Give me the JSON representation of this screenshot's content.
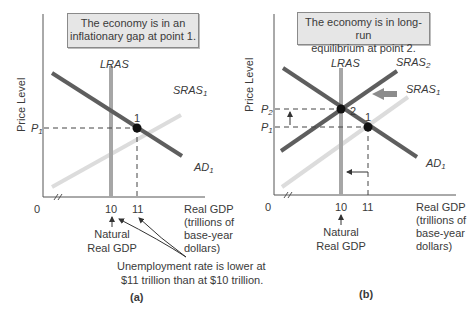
{
  "panels": [
    {
      "id": "a",
      "caption": "(a)",
      "callout": [
        "The economy is in an",
        "inflationary gap at point 1."
      ],
      "y_axis_label": "Price Level",
      "x_axis_label": [
        "Real GDP",
        "(trillions of",
        "base-year",
        "dollars)"
      ],
      "origin": "0",
      "x_ticks": [
        "10",
        "11"
      ],
      "y_ticks": [
        {
          "base": "P",
          "sub": "1"
        }
      ],
      "curves": {
        "lras": "LRAS",
        "sras1": {
          "base": "SRAS",
          "sub": "1"
        },
        "ad1": {
          "base": "AD",
          "sub": "1"
        }
      },
      "points": [
        "1"
      ],
      "annotations": {
        "natural_gdp": [
          "Natural",
          "Real GDP"
        ],
        "unemployment_note": [
          "Unemployment rate is lower at",
          "$11 trillion than at $10 trillion."
        ]
      }
    },
    {
      "id": "b",
      "caption": "(b)",
      "callout": [
        "The economy is in long-run",
        "equilibrium at point 2."
      ],
      "y_axis_label": "Price Level",
      "x_axis_label": [
        "Real GDP",
        "(trillions of",
        "base-year",
        "dollars)"
      ],
      "origin": "0",
      "x_ticks": [
        "10",
        "11"
      ],
      "y_ticks": [
        {
          "base": "P",
          "sub": "2"
        },
        {
          "base": "P",
          "sub": "1"
        }
      ],
      "curves": {
        "lras": "LRAS",
        "sras2": {
          "base": "SRAS",
          "sub": "2"
        },
        "sras1": {
          "base": "SRAS",
          "sub": "1"
        },
        "ad1": {
          "base": "AD",
          "sub": "1"
        }
      },
      "points": [
        "2",
        "1"
      ],
      "annotations": {
        "natural_gdp": [
          "Natural",
          "Real GDP"
        ]
      }
    }
  ],
  "colors": {
    "ad": "#5e5e5e",
    "sras_old": "#dcdcdc",
    "sras_new": "#5e5e5e",
    "lras": "#a6a6a6",
    "axis": "#555555",
    "box_bg": "#e6e6e6",
    "shift_arrow": "#8c8c8c"
  }
}
